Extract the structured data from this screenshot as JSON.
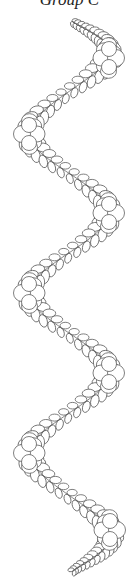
{
  "title": "Group C",
  "pattern": {
    "name": "feathered wavy vine quilting design",
    "stroke_color": "#555555",
    "background": "#ffffff",
    "flowers": [
      {
        "side": "right",
        "cx": 109,
        "cy": 58
      },
      {
        "side": "left",
        "cx": 29,
        "cy": 134
      },
      {
        "side": "right",
        "cx": 109,
        "cy": 213
      },
      {
        "side": "left",
        "cx": 29,
        "cy": 293
      },
      {
        "side": "right",
        "cx": 109,
        "cy": 373
      },
      {
        "side": "left",
        "cx": 29,
        "cy": 453
      },
      {
        "side": "right",
        "cx": 110,
        "cy": 530
      }
    ],
    "start": {
      "x": 72,
      "y": 21
    },
    "end": {
      "x": 72,
      "y": 572
    }
  }
}
